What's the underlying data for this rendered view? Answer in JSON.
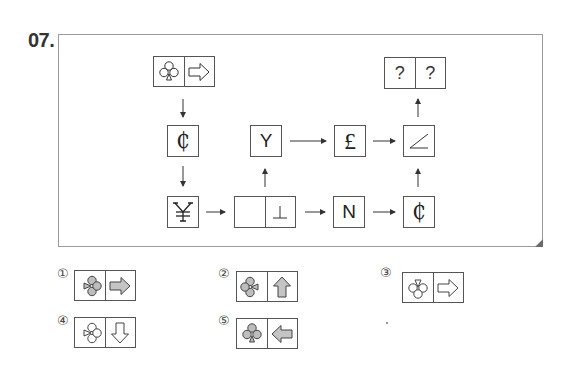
{
  "question": {
    "number": "07.",
    "diagram": {
      "start": {
        "left": "club-with-small-triangle-bottom-outline",
        "right": "arrow-right-outline"
      },
      "nodes": {
        "cedi_top": "₵",
        "y": "Y",
        "pound": "£",
        "angle": "∠",
        "yen": "¥",
        "split_left": "",
        "split_right": "⊥",
        "n": "N",
        "cedi_bottom": "₵",
        "answer_left": "?",
        "answer_right": "?"
      }
    },
    "options": [
      {
        "label": "①",
        "left": "gray-club-triangle-left",
        "right": "gray-arrow-right"
      },
      {
        "label": "②",
        "left": "gray-club-triangle-right",
        "right": "gray-arrow-up"
      },
      {
        "label": "③",
        "left": "outline-club-triangle-top",
        "right": "outline-arrow-right"
      },
      {
        "label": "④",
        "left": "outline-club-triangle-left",
        "right": "outline-arrow-down"
      },
      {
        "label": "⑤",
        "left": "gray-club-triangle-bottom",
        "right": "gray-arrow-left"
      }
    ]
  }
}
